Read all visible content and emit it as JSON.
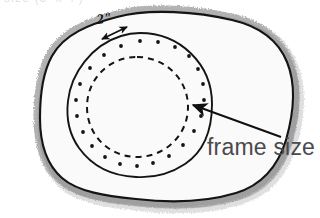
{
  "figure": {
    "title_clipped": "size (3' x 4')",
    "background_color": "#ffffff",
    "blob_fill_color": "#fafafa",
    "ink_color": "#101010",
    "shading_color": "#8a8a8a",
    "label_text_color": "#4a4a4a"
  },
  "annotations": {
    "dimension_label": "2\"",
    "callout_label": "frame size"
  },
  "shapes": {
    "outer_blob": {
      "name": "stone-slab-outline",
      "style": "solid",
      "shading": "pencil-hatch-outside"
    },
    "frame_circle": {
      "name": "frame-size-circle",
      "style": "solid",
      "center_x": 140,
      "center_y": 105,
      "radius_x": 72,
      "radius_y": 72
    },
    "bolt_holes": {
      "name": "bolt-hole-ring",
      "count": 22,
      "center_x": 140,
      "center_y": 105,
      "radius": 64,
      "dot_radius": 1.9
    },
    "inner_dashed_circle": {
      "name": "opening-circle",
      "style": "dashed",
      "center_x": 137,
      "center_y": 107,
      "radius": 50,
      "dash": "6 5"
    }
  },
  "arrows": {
    "callout_arrow": {
      "name": "frame-size-callout-arrow",
      "from_x": 280,
      "from_y": 136,
      "to_x": 190,
      "to_y": 104,
      "head": "single"
    },
    "dimension_arrow": {
      "name": "two-inch-dimension-arrow",
      "from_x": 126,
      "from_y": 28,
      "to_x": 103,
      "to_y": 38,
      "head": "double"
    }
  }
}
